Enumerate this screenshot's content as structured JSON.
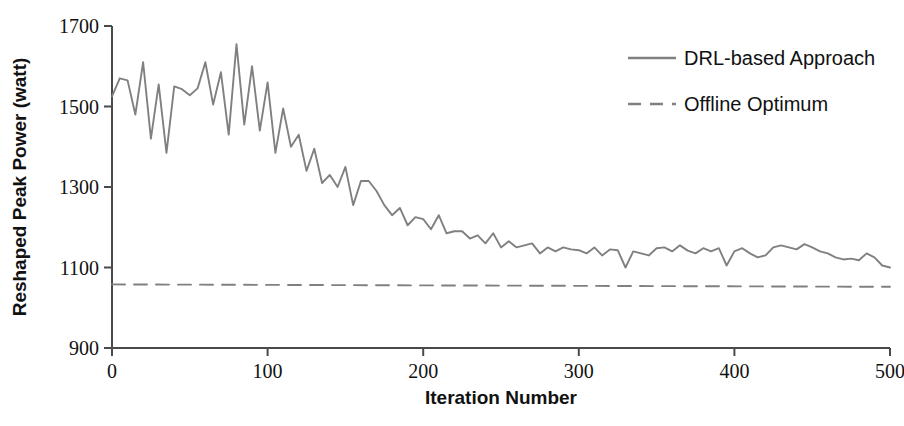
{
  "chart_data": {
    "type": "line",
    "title": "",
    "xlabel": "Iteration Number",
    "ylabel": "Reshaped Peak Power (watt)",
    "xlim": [
      0,
      500
    ],
    "ylim": [
      900,
      1700
    ],
    "xticks": [
      0,
      100,
      200,
      300,
      400,
      500
    ],
    "yticks": [
      900,
      1100,
      1300,
      1500,
      1700
    ],
    "xtick_labels": [
      "0",
      "100",
      "200",
      "300",
      "400",
      "500"
    ],
    "ytick_labels": [
      "900",
      "1100",
      "1300",
      "1500",
      "1700"
    ],
    "grid": false,
    "legend_position": "top-right",
    "series": [
      {
        "name": "DRL-based Approach",
        "style": "solid",
        "color": "#808080",
        "x": [
          0,
          5,
          10,
          15,
          20,
          25,
          30,
          35,
          40,
          45,
          50,
          55,
          60,
          65,
          70,
          75,
          80,
          85,
          90,
          95,
          100,
          105,
          110,
          115,
          120,
          125,
          130,
          135,
          140,
          145,
          150,
          155,
          160,
          165,
          170,
          175,
          180,
          185,
          190,
          195,
          200,
          205,
          210,
          215,
          220,
          225,
          230,
          235,
          240,
          245,
          250,
          255,
          260,
          265,
          270,
          275,
          280,
          285,
          290,
          295,
          300,
          305,
          310,
          315,
          320,
          325,
          330,
          335,
          340,
          345,
          350,
          355,
          360,
          365,
          370,
          375,
          380,
          385,
          390,
          395,
          400,
          405,
          410,
          415,
          420,
          425,
          430,
          435,
          440,
          445,
          450,
          455,
          460,
          465,
          470,
          475,
          480,
          485,
          490,
          495,
          500
        ],
        "values": [
          1525,
          1570,
          1565,
          1480,
          1610,
          1420,
          1555,
          1385,
          1550,
          1543,
          1528,
          1545,
          1610,
          1505,
          1585,
          1430,
          1655,
          1455,
          1600,
          1440,
          1560,
          1385,
          1495,
          1400,
          1430,
          1340,
          1395,
          1310,
          1330,
          1300,
          1350,
          1255,
          1315,
          1315,
          1290,
          1255,
          1230,
          1248,
          1205,
          1225,
          1220,
          1195,
          1230,
          1185,
          1190,
          1190,
          1172,
          1180,
          1160,
          1185,
          1150,
          1165,
          1150,
          1155,
          1160,
          1135,
          1150,
          1140,
          1150,
          1145,
          1143,
          1135,
          1150,
          1130,
          1145,
          1143,
          1100,
          1140,
          1135,
          1130,
          1148,
          1150,
          1140,
          1155,
          1142,
          1135,
          1148,
          1140,
          1148,
          1105,
          1140,
          1148,
          1135,
          1125,
          1130,
          1150,
          1155,
          1150,
          1145,
          1158,
          1150,
          1140,
          1135,
          1125,
          1120,
          1122,
          1118,
          1135,
          1125,
          1105,
          1100
        ]
      },
      {
        "name": "Offline Optimum",
        "style": "dashed",
        "color": "#808080",
        "x": [
          0,
          500
        ],
        "values": [
          1058,
          1052
        ]
      }
    ]
  },
  "legend": {
    "items": [
      {
        "label": "DRL-based Approach",
        "style": "solid"
      },
      {
        "label": "Offline Optimum",
        "style": "dashed"
      }
    ]
  }
}
